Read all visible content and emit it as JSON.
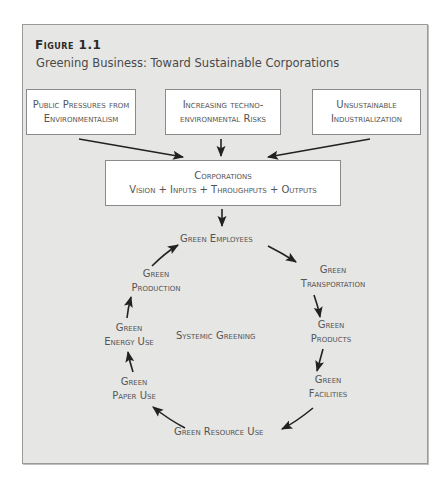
{
  "figure": {
    "label": "Figure 1.1",
    "title": "Greening Business: Toward Sustainable Corporations"
  },
  "inputs": [
    {
      "line1": "Public Pressures from",
      "line2": "Environmentalism"
    },
    {
      "line1": "Increasing techno-",
      "line2": "environmental Risks"
    },
    {
      "line1": "Unsustainable",
      "line2": "Industrialization"
    }
  ],
  "corporations": {
    "line1": "Corporations",
    "line2": "Vision + Inputs + Throughputs + Outputs"
  },
  "cycle": {
    "center": "Systemic Greening",
    "nodes": [
      {
        "line1": "Green Employees",
        "line2": ""
      },
      {
        "line1": "Green",
        "line2": "Transportation"
      },
      {
        "line1": "Green",
        "line2": "Products"
      },
      {
        "line1": "Green",
        "line2": "Facilities"
      },
      {
        "line1": "Green Resource Use",
        "line2": ""
      },
      {
        "line1": "Green",
        "line2": "Paper Use"
      },
      {
        "line1": "Green",
        "line2": "Energy Use"
      },
      {
        "line1": "Green",
        "line2": "Production"
      }
    ]
  },
  "colors": {
    "panel": "#e6e6e4",
    "box": "#ffffff",
    "arrow": "#222222",
    "text": "#555555"
  }
}
